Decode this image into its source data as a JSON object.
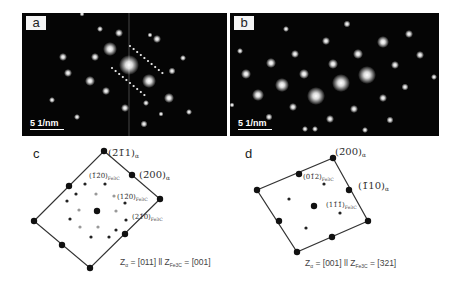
{
  "figure": {
    "panels": [
      {
        "id": "a",
        "label": "a",
        "type": "diffraction-image",
        "scale_bar": "5 1/nm"
      },
      {
        "id": "b",
        "label": "b",
        "type": "diffraction-image",
        "scale_bar": "5 1/nm"
      },
      {
        "id": "c",
        "label": "c",
        "type": "indexed-pattern",
        "annotations": [
          "(2̄1̄1)α",
          "(2̄00)α",
          "(1̄2̄0)Fe3C",
          "(12̄0)Fe3C",
          "(21̄0)Fe3C"
        ],
        "zone_axis": "Zα = [011] ll ZFe3C = [001]"
      },
      {
        "id": "d",
        "label": "d",
        "type": "indexed-pattern",
        "annotations": [
          "(2̄00)α",
          "(1̄10)α",
          "(01̄2)Fe3C",
          "(11̄1̄)Fe3C"
        ],
        "zone_axis": "Zα = [001] ll ZFe3C = [321]"
      }
    ]
  },
  "c": {
    "label": "c",
    "a211": "(2̄1̄1)",
    "a200": "(2̄00)",
    "f120a": "(1̄2̄0)",
    "f120b": "(12̄0)",
    "f210": "(21̄0)",
    "alpha": "α",
    "fe3c": "Fe3C",
    "zone_pre": "Z",
    "zone_mid": " = [011] ll Z",
    "zone_post": " = [001]"
  },
  "d": {
    "label": "d",
    "a200": "(2̄00)",
    "a110": "(1̄10)",
    "f012": "(01̄2)",
    "f111": "(11̄1̄)",
    "alpha": "α",
    "fe3c": "Fe3C",
    "zone_pre": "Z",
    "zone_mid": " = [001] ll Z",
    "zone_post": " = [321]"
  },
  "a": {
    "label": "a",
    "scale": "5 1/nm"
  },
  "b": {
    "label": "b",
    "scale": "5 1/nm"
  }
}
